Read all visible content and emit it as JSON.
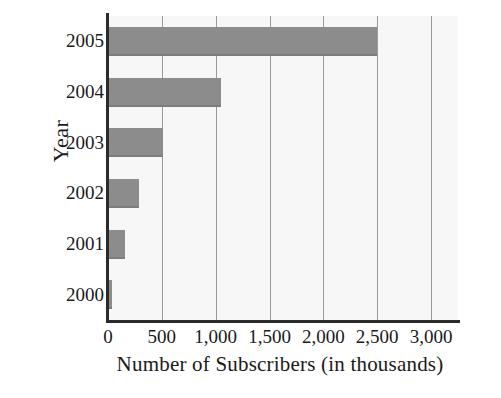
{
  "chart_data": {
    "type": "bar",
    "orientation": "horizontal",
    "title": "",
    "subtitle": "",
    "xlabel": "Number of Subscribers (in thousands)",
    "ylabel": "Year",
    "categories": [
      "2000",
      "2001",
      "2002",
      "2003",
      "2004",
      "2005"
    ],
    "values": [
      40,
      160,
      290,
      510,
      1050,
      2500
    ],
    "series": [
      {
        "name": "Number of Subscribers",
        "values": [
          40,
          160,
          290,
          510,
          1050,
          2500
        ]
      }
    ],
    "xlim": [
      0,
      3250
    ],
    "xticks": [
      0,
      500,
      1000,
      1500,
      2000,
      2500,
      3000
    ],
    "xtick_labels": [
      "0",
      "500",
      "1,000",
      "1,500",
      "2,000",
      "2,500",
      "3,000"
    ],
    "ytick_labels": [
      "2005",
      "2004",
      "2003",
      "2002",
      "2001",
      "2000"
    ],
    "grid": true,
    "grid_axis": "x",
    "legend": false,
    "legend_position": "none",
    "bar_color": "#8c8c8c",
    "plot_background": "#f7f7f7",
    "axis_color": "#2b2b2b",
    "gridline_color": "#9a9a9a"
  },
  "axes": {
    "y_title": "Year",
    "x_title": "Number of Subscribers (in thousands)"
  },
  "y_ticks": [
    {
      "label": "2005"
    },
    {
      "label": "2004"
    },
    {
      "label": "2003"
    },
    {
      "label": "2002"
    },
    {
      "label": "2001"
    },
    {
      "label": "2000"
    }
  ],
  "x_ticks": [
    {
      "label": "0",
      "value": 0
    },
    {
      "label": "500",
      "value": 500
    },
    {
      "label": "1,000",
      "value": 1000
    },
    {
      "label": "1,500",
      "value": 1500
    },
    {
      "label": "2,000",
      "value": 2000
    },
    {
      "label": "2,500",
      "value": 2500
    },
    {
      "label": "3,000",
      "value": 3000
    }
  ],
  "bars": [
    {
      "category": "2005",
      "value": 2500
    },
    {
      "category": "2004",
      "value": 1050
    },
    {
      "category": "2003",
      "value": 510
    },
    {
      "category": "2002",
      "value": 290
    },
    {
      "category": "2001",
      "value": 160
    },
    {
      "category": "2000",
      "value": 40
    }
  ]
}
